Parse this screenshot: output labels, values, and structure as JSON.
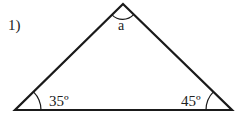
{
  "problem_number": "1)",
  "triangle": {
    "vertices": {
      "apex": [
        123,
        4
      ],
      "left": [
        15,
        110
      ],
      "right": [
        232,
        110
      ]
    },
    "angles": {
      "apex": {
        "label": "a"
      },
      "left": {
        "label": "35º",
        "value_deg": 35
      },
      "right": {
        "label": "45º",
        "value_deg": 45
      }
    }
  },
  "colors": {
    "stroke": "#1a1a1a",
    "text": "#222222",
    "background": "#ffffff"
  }
}
